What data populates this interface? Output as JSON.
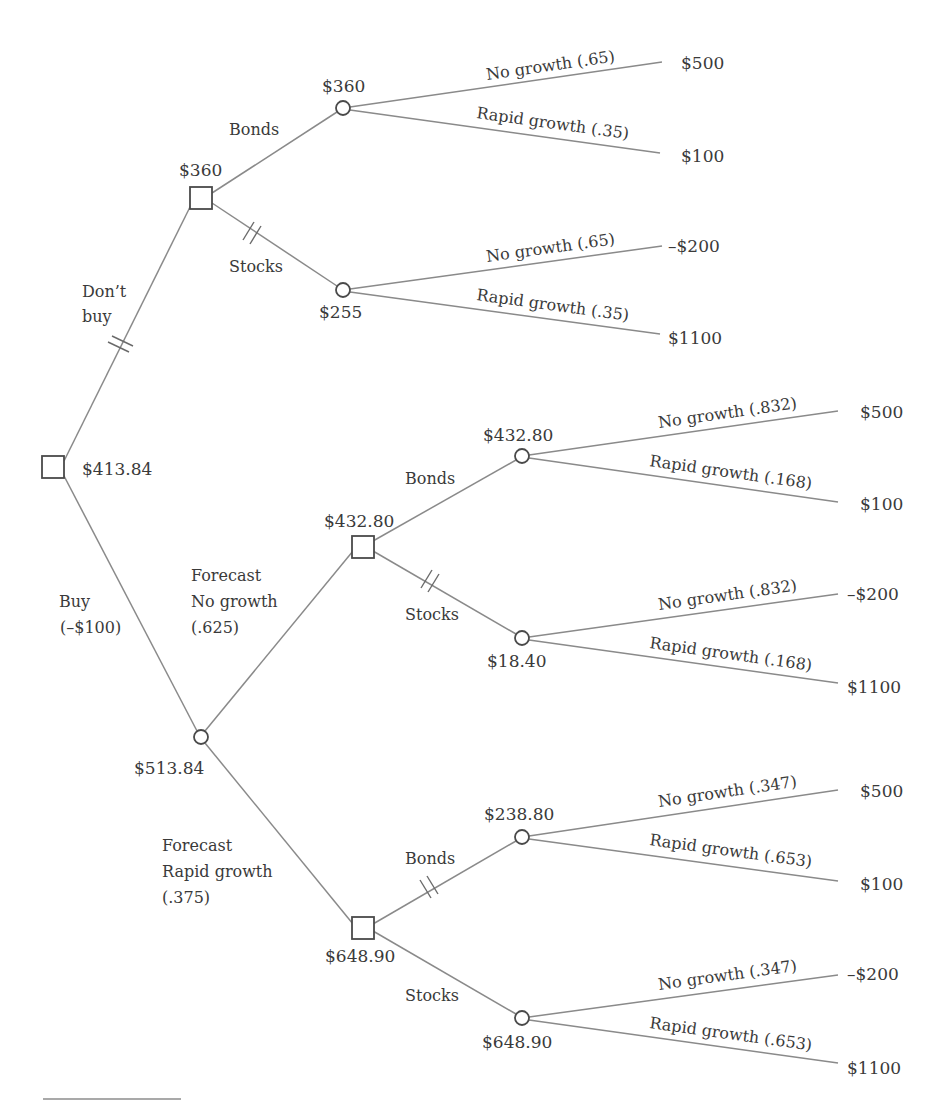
{
  "diagram": {
    "type": "decision-tree",
    "root": {
      "value": "$413.84",
      "branches": [
        {
          "label_line1": "Don’t",
          "label_line2": "buy",
          "pruned": true,
          "decision_value": "$360",
          "options": [
            {
              "label": "Bonds",
              "pruned": false,
              "chance_value": "$360",
              "outcomes": [
                {
                  "label": "No growth (.65)",
                  "payoff": "$500"
                },
                {
                  "label": "Rapid growth (.35)",
                  "payoff": "$100"
                }
              ]
            },
            {
              "label": "Stocks",
              "pruned": true,
              "chance_value": "$255",
              "outcomes": [
                {
                  "label": "No growth (.65)",
                  "payoff": "–$200"
                },
                {
                  "label": "Rapid growth (.35)",
                  "payoff": "$1100"
                }
              ]
            }
          ]
        },
        {
          "label_line1": "Buy",
          "label_line2": "(–$100)",
          "pruned": false,
          "chance_value": "$513.84",
          "forecasts": [
            {
              "label_line1": "Forecast",
              "label_line2": "No growth",
              "label_line3": "(.625)",
              "decision_value": "$432.80",
              "options": [
                {
                  "label": "Bonds",
                  "pruned": false,
                  "chance_value": "$432.80",
                  "outcomes": [
                    {
                      "label": "No growth (.832)",
                      "payoff": "$500"
                    },
                    {
                      "label": "Rapid growth (.168)",
                      "payoff": "$100"
                    }
                  ]
                },
                {
                  "label": "Stocks",
                  "pruned": true,
                  "chance_value": "$18.40",
                  "outcomes": [
                    {
                      "label": "No growth (.832)",
                      "payoff": "–$200"
                    },
                    {
                      "label": "Rapid growth (.168)",
                      "payoff": "$1100"
                    }
                  ]
                }
              ]
            },
            {
              "label_line1": "Forecast",
              "label_line2": "Rapid growth",
              "label_line3": "(.375)",
              "decision_value": "$648.90",
              "options": [
                {
                  "label": "Bonds",
                  "pruned": true,
                  "chance_value": "$238.80",
                  "outcomes": [
                    {
                      "label": "No growth (.347)",
                      "payoff": "$500"
                    },
                    {
                      "label": "Rapid growth (.653)",
                      "payoff": "$100"
                    }
                  ]
                },
                {
                  "label": "Stocks",
                  "pruned": false,
                  "chance_value": "$648.90",
                  "outcomes": [
                    {
                      "label": "No growth (.347)",
                      "payoff": "–$200"
                    },
                    {
                      "label": "Rapid growth (.653)",
                      "payoff": "$1100"
                    }
                  ]
                }
              ]
            }
          ]
        }
      ]
    },
    "legend": {
      "decision_node_shape": "square",
      "chance_node_shape": "circle",
      "pruned_branch_mark": "double-hash"
    }
  }
}
